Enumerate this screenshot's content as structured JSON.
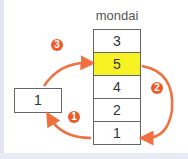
{
  "diagram": {
    "stack_label": "mondai",
    "stack_cells": [
      "3",
      "5",
      "4",
      "2",
      "1"
    ],
    "highlight_index": 1,
    "temp_value": "1",
    "steps": [
      "1",
      "2",
      "3"
    ],
    "colors": {
      "arrow": "#f07040",
      "highlight": "#f7f224",
      "badge": "#ee5a2a"
    }
  }
}
